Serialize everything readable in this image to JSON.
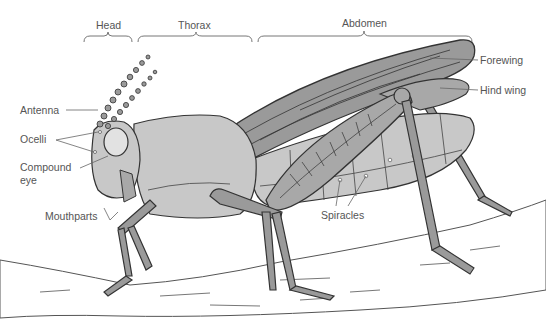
{
  "diagram": {
    "regions": [
      {
        "label": "Head"
      },
      {
        "label": "Thorax"
      },
      {
        "label": "Abdomen"
      }
    ],
    "labels": {
      "antenna": "Antenna",
      "ocelli": "Ocelli",
      "compound_eye_1": "Compound",
      "compound_eye_2": "eye",
      "mouthparts": "Mouthparts",
      "spiracles": "Spiracles",
      "forewing": "Forewing",
      "hind_wing": "Hind wing"
    },
    "colors": {
      "body": "#c8c8c8",
      "body_dark": "#a8a8a8",
      "wing": "#9a9a9a",
      "outline": "#3a3a3a",
      "label_text": "#555555",
      "leader_line": "#666666"
    }
  }
}
